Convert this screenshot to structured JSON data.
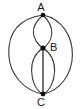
{
  "diagram": {
    "kind": "multigraph-theta-diagram",
    "background_color": "#ffffff",
    "stroke_color": "#3a3a3a",
    "vertex_color": "#111111",
    "label_color": "#1a1a1a",
    "vertices": [
      {
        "id": "A",
        "label": "A",
        "x": 43,
        "y": 15
      },
      {
        "id": "B",
        "label": "B",
        "x": 43,
        "y": 48
      },
      {
        "id": "C",
        "label": "C",
        "x": 43,
        "y": 94
      }
    ],
    "edges": [
      {
        "id": "outer-left",
        "from": "A",
        "to": "C",
        "shape": "arc",
        "bulge": "left",
        "extent_x": 9
      },
      {
        "id": "outer-right",
        "from": "A",
        "to": "C",
        "shape": "arc",
        "bulge": "right",
        "extent_x": 73
      },
      {
        "id": "upper-lens-left",
        "from": "A",
        "to": "B",
        "shape": "arc",
        "bulge": "left",
        "extent_x": 33
      },
      {
        "id": "upper-lens-right",
        "from": "A",
        "to": "B",
        "shape": "arc",
        "bulge": "right",
        "extent_x": 52
      },
      {
        "id": "lower-lens-left",
        "from": "B",
        "to": "C",
        "shape": "arc",
        "bulge": "left",
        "extent_x": 31
      },
      {
        "id": "lower-lens-right",
        "from": "B",
        "to": "C",
        "shape": "arc",
        "bulge": "right",
        "extent_x": 55
      },
      {
        "id": "middle-straight",
        "from": "B",
        "to": "C",
        "shape": "line",
        "bulge": "none",
        "extent_x": 43
      }
    ]
  }
}
